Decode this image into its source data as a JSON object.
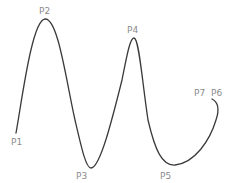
{
  "diagram": {
    "type": "spline-curve",
    "curve_color": "#3a3a3a",
    "label_color": "#8a8a8a",
    "points": [
      {
        "id": "P1",
        "label": "P1"
      },
      {
        "id": "P2",
        "label": "P2"
      },
      {
        "id": "P3",
        "label": "P3"
      },
      {
        "id": "P4",
        "label": "P4"
      },
      {
        "id": "P5",
        "label": "P5"
      },
      {
        "id": "P6",
        "label": "P6"
      },
      {
        "id": "P7",
        "label": "P7"
      }
    ]
  }
}
